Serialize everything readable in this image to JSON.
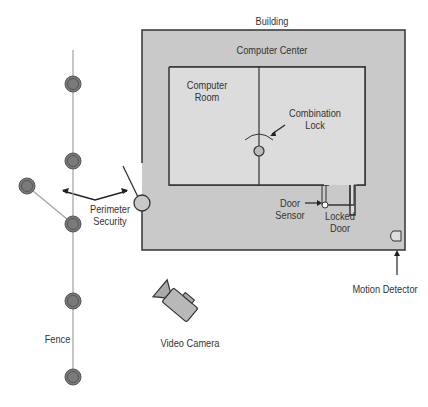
{
  "diagram": {
    "labels": {
      "building": "Building",
      "computer_center": "Computer Center",
      "computer_room_1": "Computer",
      "computer_room_2": "Room",
      "combination_lock_1": "Combination",
      "combination_lock_2": "Lock",
      "door_sensor_1": "Door",
      "door_sensor_2": "Sensor",
      "locked_door_1": "Locked",
      "locked_door_2": "Door",
      "perimeter_security_1": "Perimeter",
      "perimeter_security_2": "Security",
      "motion_detector": "Motion Detector",
      "video_camera": "Video Camera",
      "fence": "Fence"
    },
    "colors": {
      "building_fill": "#c9c9c9",
      "room_fill": "#dcdcdc",
      "wall": "#333333",
      "fence_post": "#7a7a7a",
      "fence_line": "#a0a0a0"
    }
  }
}
